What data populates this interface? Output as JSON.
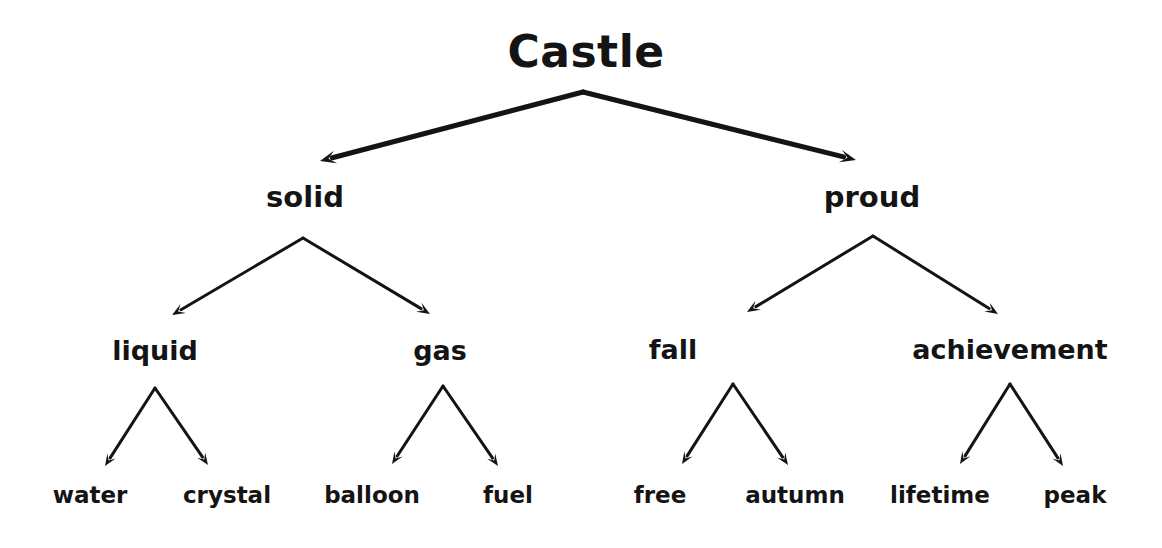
{
  "diagram": {
    "title": "Castle",
    "type": "tree-diagram",
    "background_color": "#ffffff",
    "ink_color": "#141414",
    "nodes": {
      "root": {
        "label": "Castle",
        "x": 586,
        "y": 52,
        "level": 0
      },
      "solid": {
        "label": "solid",
        "x": 305,
        "y": 197,
        "level": 1
      },
      "proud": {
        "label": "proud",
        "x": 872,
        "y": 197,
        "level": 1
      },
      "liquid": {
        "label": "liquid",
        "x": 155,
        "y": 350,
        "level": 2
      },
      "gas": {
        "label": "gas",
        "x": 440,
        "y": 350,
        "level": 2
      },
      "fall": {
        "label": "fall",
        "x": 673,
        "y": 349,
        "level": 2
      },
      "achievement": {
        "label": "achievement",
        "x": 1010,
        "y": 349,
        "level": 2
      },
      "water": {
        "label": "water",
        "x": 90,
        "y": 495,
        "level": 3
      },
      "crystal": {
        "label": "crystal",
        "x": 227,
        "y": 495,
        "level": 3
      },
      "balloon": {
        "label": "balloon",
        "x": 372,
        "y": 495,
        "level": 3
      },
      "fuel": {
        "label": "fuel",
        "x": 508,
        "y": 495,
        "level": 3
      },
      "free": {
        "label": "free",
        "x": 660,
        "y": 495,
        "level": 3
      },
      "autumn": {
        "label": "autumn",
        "x": 795,
        "y": 495,
        "level": 3
      },
      "lifetime": {
        "label": "lifetime",
        "x": 940,
        "y": 495,
        "level": 3
      },
      "peak": {
        "label": "peak",
        "x": 1075,
        "y": 495,
        "level": 3
      }
    },
    "edges": [
      {
        "from": "root",
        "to": "solid",
        "x1": 583,
        "y1": 92,
        "x2": 320,
        "y2": 161,
        "width": 5,
        "head": 16
      },
      {
        "from": "root",
        "to": "proud",
        "x1": 583,
        "y1": 92,
        "x2": 856,
        "y2": 160,
        "width": 5,
        "head": 16
      },
      {
        "from": "solid",
        "to": "liquid",
        "x1": 303,
        "y1": 238,
        "x2": 172,
        "y2": 315,
        "width": 3,
        "head": 13
      },
      {
        "from": "solid",
        "to": "gas",
        "x1": 303,
        "y1": 238,
        "x2": 430,
        "y2": 314,
        "width": 3,
        "head": 13
      },
      {
        "from": "proud",
        "to": "fall",
        "x1": 873,
        "y1": 236,
        "x2": 747,
        "y2": 312,
        "width": 3,
        "head": 13
      },
      {
        "from": "proud",
        "to": "achievement",
        "x1": 873,
        "y1": 236,
        "x2": 998,
        "y2": 314,
        "width": 3,
        "head": 13
      },
      {
        "from": "liquid",
        "to": "water",
        "x1": 155,
        "y1": 388,
        "x2": 105,
        "y2": 466,
        "width": 3,
        "head": 12
      },
      {
        "from": "liquid",
        "to": "crystal",
        "x1": 155,
        "y1": 388,
        "x2": 208,
        "y2": 465,
        "width": 3,
        "head": 12
      },
      {
        "from": "gas",
        "to": "balloon",
        "x1": 443,
        "y1": 386,
        "x2": 392,
        "y2": 464,
        "width": 3,
        "head": 12
      },
      {
        "from": "gas",
        "to": "fuel",
        "x1": 443,
        "y1": 386,
        "x2": 498,
        "y2": 466,
        "width": 3,
        "head": 12
      },
      {
        "from": "fall",
        "to": "free",
        "x1": 733,
        "y1": 384,
        "x2": 682,
        "y2": 464,
        "width": 3,
        "head": 12
      },
      {
        "from": "fall",
        "to": "autumn",
        "x1": 733,
        "y1": 384,
        "x2": 788,
        "y2": 465,
        "width": 3,
        "head": 12
      },
      {
        "from": "achievement",
        "to": "lifetime",
        "x1": 1010,
        "y1": 384,
        "x2": 960,
        "y2": 464,
        "width": 3,
        "head": 12
      },
      {
        "from": "achievement",
        "to": "peak",
        "x1": 1010,
        "y1": 384,
        "x2": 1063,
        "y2": 466,
        "width": 3,
        "head": 12
      }
    ]
  }
}
